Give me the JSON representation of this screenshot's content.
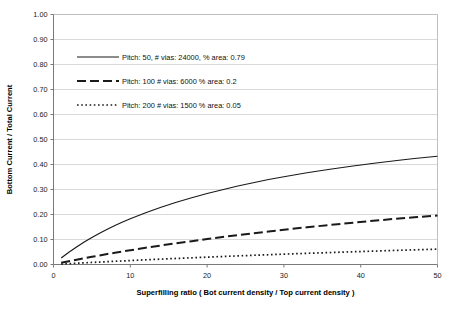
{
  "chart_data": {
    "type": "line",
    "title": "",
    "xlabel": "Superfilling ratio ( Bot current density / Top current density )",
    "ylabel": "Bottom Current / Total Current",
    "xlim": [
      0,
      50
    ],
    "ylim": [
      0,
      1.0
    ],
    "grid": true,
    "grid_axis": "y",
    "legend_position": "upper-left-inside",
    "x_ticks": [
      "0",
      "10",
      "20",
      "30",
      "40",
      "50"
    ],
    "x_tick_values": [
      0,
      10,
      20,
      30,
      40,
      50
    ],
    "y_ticks": [
      "0.00",
      "0.10",
      "0.20",
      "0.30",
      "0.40",
      "0.50",
      "0.60",
      "0.70",
      "0.80",
      "0.90",
      "1.00"
    ],
    "y_tick_values": [
      0,
      0.1,
      0.2,
      0.3,
      0.4,
      0.5,
      0.6,
      0.7,
      0.8,
      0.9,
      1.0
    ],
    "x": [
      1,
      2,
      3,
      4,
      5,
      6,
      7,
      8,
      9,
      10,
      12,
      14,
      16,
      18,
      20,
      22,
      24,
      26,
      28,
      30,
      33,
      36,
      39,
      42,
      45,
      47,
      50
    ],
    "series": [
      {
        "name": "Pitch: 50, # vias: 24000, % area: 0.79",
        "style": "solid",
        "pitch": 50,
        "vias": 24000,
        "area_fraction": 0.79,
        "values": [
          0.026,
          0.049,
          0.07,
          0.09,
          0.108,
          0.125,
          0.141,
          0.156,
          0.17,
          0.183,
          0.207,
          0.229,
          0.249,
          0.267,
          0.284,
          0.299,
          0.314,
          0.327,
          0.34,
          0.351,
          0.367,
          0.381,
          0.394,
          0.406,
          0.417,
          0.424,
          0.433
        ]
      },
      {
        "name": "Pitch: 100 # vias: 6000 % area: 0.2",
        "style": "dashed",
        "pitch": 100,
        "vias": 6000,
        "area_fraction": 0.2,
        "values": [
          0.007,
          0.013,
          0.019,
          0.025,
          0.031,
          0.036,
          0.042,
          0.047,
          0.052,
          0.057,
          0.067,
          0.076,
          0.085,
          0.093,
          0.102,
          0.11,
          0.117,
          0.125,
          0.132,
          0.139,
          0.149,
          0.158,
          0.167,
          0.176,
          0.184,
          0.189,
          0.196
        ]
      },
      {
        "name": "Pitch: 200 # vias: 1500 % area: 0.05",
        "style": "dotted",
        "pitch": 200,
        "vias": 1500,
        "area_fraction": 0.05,
        "values": [
          0.0017,
          0.0034,
          0.005,
          0.0066,
          0.0082,
          0.0098,
          0.0113,
          0.0128,
          0.0143,
          0.0158,
          0.0187,
          0.0215,
          0.0242,
          0.0268,
          0.0294,
          0.0319,
          0.0344,
          0.0368,
          0.0391,
          0.0414,
          0.0447,
          0.0478,
          0.0509,
          0.0539,
          0.0568,
          0.0586,
          0.0613
        ]
      }
    ],
    "legend_entries": [
      {
        "label": "Pitch: 50, # vias: 24000, % area: 0.79",
        "style": "solid"
      },
      {
        "label": "Pitch: 100 # vias: 6000 % area: 0.2",
        "style": "dashed"
      },
      {
        "label": "Pitch: 200 # vias: 1500 % area: 0.05",
        "style": "dotted"
      }
    ],
    "colors": {
      "line": "#1a1a1a",
      "grid": "#d9d9d9",
      "axis": "#808080",
      "background": "#ffffff",
      "text": "#111111"
    }
  }
}
